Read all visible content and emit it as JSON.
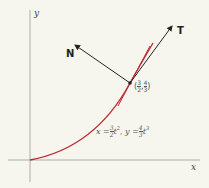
{
  "diagram": {
    "axes": {
      "x_label": "x",
      "y_label": "y"
    },
    "vectors": {
      "tangent_label": "T",
      "normal_label": "N"
    },
    "point": {
      "x_num": "3",
      "x_den": "2",
      "y_num": "4",
      "y_den": "3",
      "open": "(",
      "comma": ",",
      "close": ")"
    },
    "equation": {
      "x_lhs": "x =",
      "x_num": "3",
      "x_den": "2",
      "x_var": "t",
      "x_exp": "2",
      "sep": ",",
      "y_lhs": "y =",
      "y_num": "4",
      "y_den": "3",
      "y_var": "t",
      "y_exp": "3"
    },
    "colors": {
      "curve": "#c0262e",
      "axis": "#9a9a9a",
      "vector": "#222222",
      "background": "#f6f5ee"
    }
  }
}
